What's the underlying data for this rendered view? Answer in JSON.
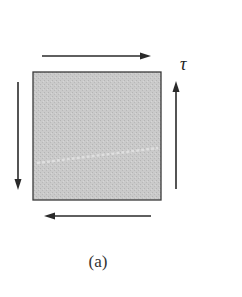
{
  "figure": {
    "caption": "(a)",
    "stress_label": "τ",
    "element_fill": "#c8c8c8",
    "stroke_color": "#2a2a2a",
    "element": {
      "x": 33,
      "y": 72,
      "width": 128,
      "height": 128
    },
    "arrows": [
      {
        "name": "top-shear-arrow",
        "direction": "right"
      },
      {
        "name": "bottom-shear-arrow",
        "direction": "left"
      },
      {
        "name": "left-shear-arrow",
        "direction": "down"
      },
      {
        "name": "right-shear-arrow",
        "direction": "up"
      }
    ]
  }
}
